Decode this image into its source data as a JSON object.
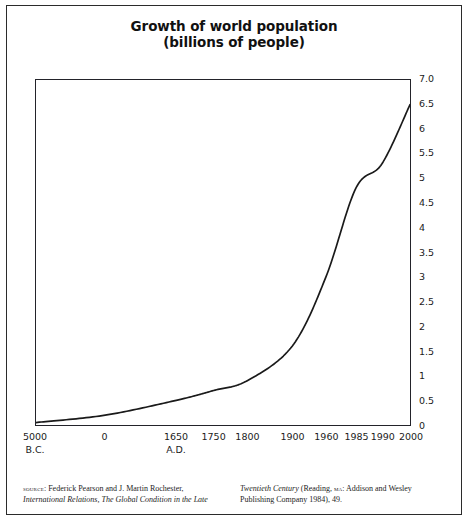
{
  "figure": {
    "title_line1": "Growth of world population",
    "title_line2": "(billions of people)"
  },
  "chart_data": {
    "type": "line",
    "title": "Growth of world population (billions of people)",
    "subtitle": "(billions of people)",
    "xlabel": "",
    "ylabel": "billions of people",
    "grid": false,
    "legend": null,
    "ylim": [
      0,
      7.0
    ],
    "x_tick_labels": [
      "5000",
      "0",
      "1650",
      "1750",
      "1800",
      "1900",
      "1960",
      "1985",
      "1990",
      "2000"
    ],
    "x_tick_eras": [
      "B.C.",
      "",
      "A.D.",
      "",
      "",
      "",
      "",
      "",
      "",
      ""
    ],
    "y_tick_labels": [
      "7.0",
      "6.5",
      "6",
      "5.5",
      "5",
      "4.5",
      "4",
      "3.5",
      "3",
      "2.5",
      "2",
      "1.5",
      "1",
      "0.5",
      "0"
    ],
    "y_tick_values": [
      7.0,
      6.5,
      6.0,
      5.5,
      5.0,
      4.5,
      4.0,
      3.5,
      3.0,
      2.5,
      2.0,
      1.5,
      1.0,
      0.5,
      0
    ],
    "x": [
      "5000 B.C.",
      "0 A.D.",
      "1650",
      "1750",
      "1800",
      "1900",
      "1960",
      "1985",
      "1990",
      "2000"
    ],
    "values": [
      0.05,
      0.2,
      0.5,
      0.7,
      0.9,
      1.6,
      3.0,
      4.8,
      5.3,
      6.5
    ],
    "series": [
      {
        "name": "World population",
        "values": [
          0.05,
          0.2,
          0.5,
          0.7,
          0.9,
          1.6,
          3.0,
          4.8,
          5.3,
          6.5
        ]
      }
    ],
    "line_color": "#1a1a1a"
  },
  "source": {
    "label": "source",
    "left_line1": ": Federick Pearson and J. Martin Rochester,",
    "left_line2_italic": "International Relations, The Global Condition in the Late",
    "right_line1_italic": "Twentieth Century",
    "right_line1_rest_a": " (Reading, ",
    "right_line1_smallcaps": "ma",
    "right_line1_rest_b": ": Addison and Wesley",
    "right_line2": "Publishing Company 1984), 49."
  }
}
